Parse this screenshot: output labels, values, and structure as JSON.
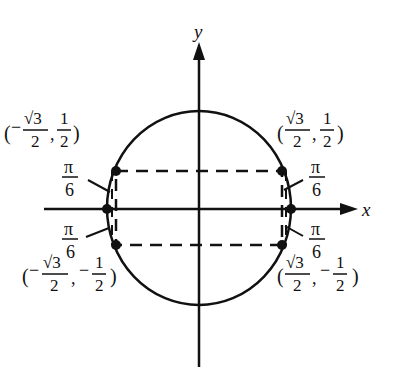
{
  "diagram": {
    "axes": {
      "x_label": "x",
      "y_label": "y"
    },
    "points": [
      {
        "id": "q1",
        "x_num": "√3",
        "x_den": "2",
        "x_sign": "",
        "y_num": "1",
        "y_den": "2",
        "y_sign": ""
      },
      {
        "id": "q2",
        "x_num": "√3",
        "x_den": "2",
        "x_sign": "−",
        "y_num": "1",
        "y_den": "2",
        "y_sign": ""
      },
      {
        "id": "q3",
        "x_num": "√3",
        "x_den": "2",
        "x_sign": "−",
        "y_num": "1",
        "y_den": "2",
        "y_sign": "−"
      },
      {
        "id": "q4",
        "x_num": "√3",
        "x_den": "2",
        "x_sign": "",
        "y_num": "1",
        "y_den": "2",
        "y_sign": "−"
      }
    ],
    "angle_label": {
      "num": "π",
      "den": "6"
    },
    "colors": {
      "ink": "#111111",
      "background": "#ffffff"
    }
  }
}
